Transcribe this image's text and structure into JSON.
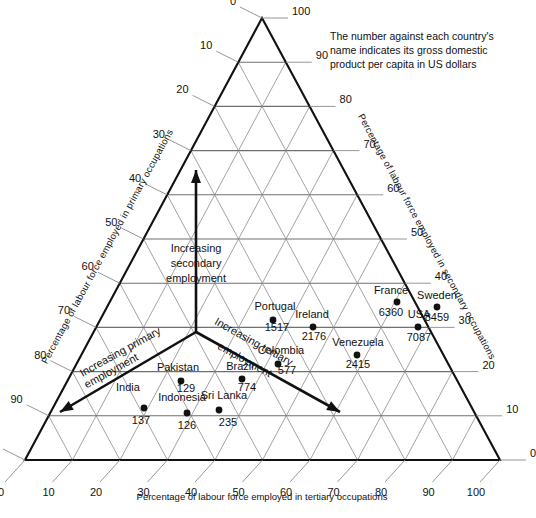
{
  "note": {
    "line1": "The number against each country's",
    "line2": "name indicates its gross domestic",
    "line3": "product per capita in US dollars"
  },
  "axes": {
    "left_title": "Percentage of labour force employed in primary occupations",
    "right_title": "Percentage of labour force employed in secondary occupations",
    "bottom_title": "Percentage of labour force employed in tertiary occupations",
    "ticks": [
      0,
      10,
      20,
      30,
      40,
      50,
      60,
      70,
      80,
      90,
      100
    ]
  },
  "arrows": [
    {
      "label_line1": "Increasing",
      "label_line2": "secondary",
      "label_line3": "employment",
      "direction": "up"
    },
    {
      "label_line1": "Increasing primary",
      "label_line2": "employment",
      "direction": "down-left"
    },
    {
      "label_line1": "Increasing tertiary",
      "label_line2": "employment",
      "direction": "down-right"
    }
  ],
  "chart_data": {
    "type": "scatter",
    "subtype": "ternary",
    "title": "",
    "note": "The number against each country's name indicates its gross domestic product per capita in US dollars",
    "axis_labels": {
      "a": "Percentage of labour force employed in primary occupations",
      "b": "Percentage of labour force employed in secondary occupations",
      "c": "Percentage of labour force employed in tertiary occupations"
    },
    "axis_range": [
      0,
      100
    ],
    "tick_step": 10,
    "grid": true,
    "legend": "none",
    "value_label": "GDP per capita (US dollars)",
    "points": [
      {
        "name": "India",
        "value": 137,
        "primary": 72,
        "secondary": 11,
        "tertiary": 17
      },
      {
        "name": "Indonesia",
        "value": 126,
        "primary": 68,
        "secondary": 10,
        "tertiary": 22
      },
      {
        "name": "Sri Lanka",
        "value": 235,
        "primary": 56,
        "secondary": 14,
        "tertiary": 30
      },
      {
        "name": "Pakistan",
        "value": 129,
        "primary": 58,
        "secondary": 19,
        "tertiary": 23
      },
      {
        "name": "Brazil",
        "value": 774,
        "primary": 44,
        "secondary": 21,
        "tertiary": 35
      },
      {
        "name": "Colombia",
        "value": 577,
        "primary": 34,
        "secondary": 26,
        "tertiary": 40
      },
      {
        "name": "Portugal",
        "value": 1517,
        "primary": 30,
        "secondary": 34,
        "tertiary": 36
      },
      {
        "name": "Ireland",
        "value": 2176,
        "primary": 26,
        "secondary": 32,
        "tertiary": 42
      },
      {
        "name": "Venezuela",
        "value": 2415,
        "primary": 20,
        "secondary": 26,
        "tertiary": 54
      },
      {
        "name": "France",
        "value": 6360,
        "primary": 13,
        "secondary": 41,
        "tertiary": 46
      },
      {
        "name": "Sweden",
        "value": 8459,
        "primary": 8,
        "secondary": 38,
        "tertiary": 54
      },
      {
        "name": "USA",
        "value": 7087,
        "primary": 5,
        "secondary": 32,
        "tertiary": 63
      }
    ],
    "point_pixels": [
      {
        "name": "India",
        "x": 144,
        "y": 408,
        "nx": 128,
        "ny": 391,
        "vx": 141,
        "vy": 424,
        "nanchor": "middle",
        "vanchor": "middle"
      },
      {
        "name": "Indonesia",
        "x": 187,
        "y": 413,
        "nx": 182,
        "ny": 401,
        "vx": 187,
        "vy": 429,
        "nanchor": "middle",
        "vanchor": "middle"
      },
      {
        "name": "Sri Lanka",
        "x": 219,
        "y": 410,
        "nx": 224,
        "ny": 399,
        "vx": 228,
        "vy": 426,
        "nanchor": "middle",
        "vanchor": "middle"
      },
      {
        "name": "Pakistan",
        "x": 181,
        "y": 381,
        "nx": 178,
        "ny": 371,
        "vx": 186,
        "vy": 392,
        "nanchor": "middle",
        "vanchor": "middle"
      },
      {
        "name": "Brazil",
        "x": 242,
        "y": 379,
        "nx": 240,
        "ny": 370,
        "vx": 247,
        "vy": 391,
        "nanchor": "middle",
        "vanchor": "middle"
      },
      {
        "name": "Colombia",
        "x": 278,
        "y": 364,
        "nx": 281,
        "ny": 354,
        "vx": 287,
        "vy": 374,
        "nanchor": "middle",
        "vanchor": "middle"
      },
      {
        "name": "Portugal",
        "x": 273,
        "y": 320,
        "nx": 275,
        "ny": 310,
        "vx": 277,
        "vy": 331,
        "nanchor": "middle",
        "vanchor": "middle"
      },
      {
        "name": "Ireland",
        "x": 313,
        "y": 327,
        "nx": 312,
        "ny": 318,
        "vx": 314,
        "vy": 340,
        "nanchor": "middle",
        "vanchor": "middle"
      },
      {
        "name": "Venezuela",
        "x": 357,
        "y": 355,
        "nx": 358,
        "ny": 346,
        "vx": 358,
        "vy": 368,
        "nanchor": "middle",
        "vanchor": "middle"
      },
      {
        "name": "France",
        "x": 397,
        "y": 302,
        "nx": 391,
        "ny": 294,
        "vx": 391,
        "vy": 316,
        "nanchor": "middle",
        "vanchor": "middle"
      },
      {
        "name": "Sweden",
        "x": 437,
        "y": 307,
        "nx": 437,
        "ny": 299,
        "vx": 437,
        "vy": 321,
        "nanchor": "middle",
        "vanchor": "middle"
      },
      {
        "name": "USA",
        "x": 418,
        "y": 327,
        "nx": 419,
        "ny": 318,
        "vx": 419,
        "vy": 341,
        "nanchor": "middle",
        "vanchor": "middle"
      }
    ]
  }
}
